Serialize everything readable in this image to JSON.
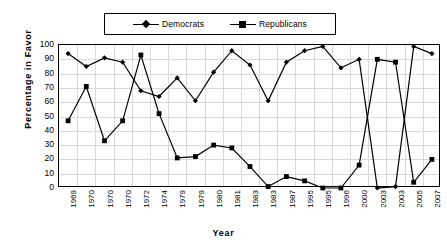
{
  "chart_data": {
    "type": "line",
    "title": "",
    "xlabel": "Year",
    "ylabel": "Percentage in Favor",
    "ylim": [
      0,
      100
    ],
    "ytick_step": 10,
    "yticks": [
      100,
      90,
      80,
      70,
      60,
      50,
      40,
      30,
      20,
      10,
      0
    ],
    "grid": true,
    "legend_position": "top-center",
    "categories": [
      "1969",
      "1970",
      "1970",
      "1970",
      "1972",
      "1974",
      "1979",
      "1979",
      "1980",
      "1981",
      "1983",
      "1983",
      "1987",
      "1995",
      "1995",
      "1996",
      "2000",
      "2003",
      "2003",
      "2005",
      "2007"
    ],
    "series": [
      {
        "name": "Democrats",
        "marker": "diamond",
        "color": "#000000",
        "values": [
          94,
          85,
          91,
          88,
          68,
          64,
          77,
          61,
          81,
          96,
          86,
          61,
          88,
          96,
          99,
          84,
          90,
          0,
          1,
          99,
          94
        ]
      },
      {
        "name": "Republicans",
        "marker": "square",
        "color": "#000000",
        "values": [
          47,
          71,
          33,
          47,
          93,
          52,
          21,
          22,
          30,
          28,
          15,
          1,
          8,
          5,
          0,
          0,
          16,
          90,
          88,
          4,
          20
        ]
      }
    ],
    "annotations": []
  },
  "legend": {
    "entries": [
      {
        "label": "Democrats"
      },
      {
        "label": "Republicans"
      }
    ]
  },
  "axes": {
    "y_title": "Percentage in Favor",
    "x_title": "Year"
  },
  "footer": {
    "artifact": ""
  }
}
